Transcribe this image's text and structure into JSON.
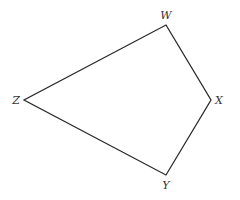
{
  "diagram": {
    "stroke_color": "#2b2b2b",
    "label_color": "#333333",
    "vertices": [
      {
        "name": "W",
        "x": 166,
        "y": 25,
        "label_x": 166,
        "label_y": 19,
        "anchor": "middle"
      },
      {
        "name": "X",
        "x": 211,
        "y": 100,
        "label_x": 215,
        "label_y": 104,
        "anchor": "start"
      },
      {
        "name": "Y",
        "x": 166,
        "y": 175,
        "label_x": 166,
        "label_y": 188,
        "anchor": "middle"
      },
      {
        "name": "Z",
        "x": 24,
        "y": 100,
        "label_x": 20,
        "label_y": 104,
        "anchor": "end"
      }
    ],
    "edges": [
      [
        "W",
        "X"
      ],
      [
        "X",
        "Y"
      ],
      [
        "Y",
        "Z"
      ],
      [
        "Z",
        "W"
      ]
    ],
    "labels": {
      "w": "W",
      "x": "X",
      "y": "Y",
      "z": "Z"
    }
  }
}
